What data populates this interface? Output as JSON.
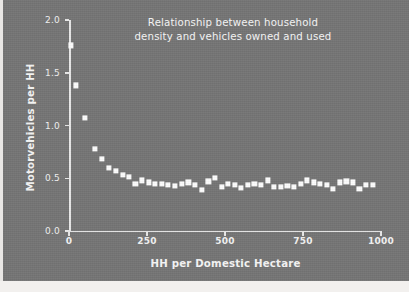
{
  "chart_data": {
    "type": "scatter",
    "title": "Relationship between household density and vehicles owned and used",
    "title_lines": [
      "Relationship between household",
      "density and vehicles owned and used"
    ],
    "xlabel": "HH per Domestic Hectare",
    "ylabel": "Motorvehicles per HH",
    "xlim": [
      0,
      1000
    ],
    "ylim": [
      0.0,
      2.0
    ],
    "xticks": [
      0,
      250,
      500,
      750,
      1000
    ],
    "xtick_labels": [
      "0",
      "250",
      "500",
      "750",
      "1000"
    ],
    "yticks": [
      0.0,
      0.5,
      1.0,
      1.5,
      2.0
    ],
    "ytick_labels": [
      "0.0",
      "0.5",
      "1.0",
      "1.5",
      "2.0"
    ],
    "grid": false,
    "legend": null,
    "marker": "square",
    "marker_color": "#fdfdfd",
    "background_color": "#757575",
    "axis_color": "#e8e8e8",
    "text_color": "#f5f5f5",
    "x": [
      5,
      22,
      52,
      82,
      106,
      128,
      150,
      172,
      193,
      213,
      234,
      255,
      276,
      297,
      318,
      340,
      361,
      383,
      404,
      425,
      447,
      468,
      489,
      510,
      531,
      552,
      573,
      594,
      616,
      637,
      658,
      679,
      700,
      721,
      742,
      763,
      784,
      805,
      826,
      847,
      868,
      889,
      910,
      931,
      952,
      973
    ],
    "y": [
      1.76,
      1.38,
      1.07,
      0.78,
      0.68,
      0.6,
      0.57,
      0.53,
      0.51,
      0.45,
      0.48,
      0.46,
      0.45,
      0.45,
      0.44,
      0.43,
      0.45,
      0.46,
      0.44,
      0.39,
      0.47,
      0.5,
      0.42,
      0.45,
      0.44,
      0.41,
      0.44,
      0.45,
      0.44,
      0.48,
      0.42,
      0.42,
      0.43,
      0.42,
      0.45,
      0.48,
      0.46,
      0.45,
      0.44,
      0.4,
      0.46,
      0.47,
      0.46,
      0.4,
      0.44,
      0.44
    ]
  }
}
